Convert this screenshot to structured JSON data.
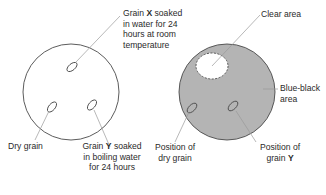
{
  "diagram": {
    "left_dish": {
      "label_x": [
        "Grain ",
        "X",
        " soaked",
        "in water for 24",
        "hours at room",
        "temperature"
      ],
      "label_dry": "Dry grain",
      "label_y": [
        "Grain ",
        "Y",
        " soaked",
        "in boiling water",
        "for 24 hours"
      ]
    },
    "right_dish": {
      "label_clear": "Clear area",
      "label_blueblack": [
        "Blue-black",
        "area"
      ],
      "label_dry_pos": [
        "Position of",
        "dry grain"
      ],
      "label_y_pos": [
        "Position of",
        "grain ",
        "Y"
      ]
    },
    "colors": {
      "outline": "#4a4a4a",
      "leader": "#9a9a9a",
      "starch_fill": "#b4b4b4",
      "clear_fill": "#ffffff"
    }
  }
}
